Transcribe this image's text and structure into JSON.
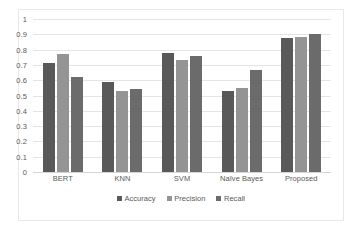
{
  "chart_data": {
    "type": "bar",
    "title": "",
    "subtitle": "",
    "xlabel": "",
    "ylabel": "",
    "ylim": [
      0,
      1
    ],
    "y_ticks": [
      "0",
      "0.1",
      "0.2",
      "0.3",
      "0.4",
      "0.5",
      "0.6",
      "0.7",
      "0.8",
      "0.9",
      "1"
    ],
    "grid": true,
    "legend_position": "bottom",
    "categories": [
      "BERT",
      "KNN",
      "SVM",
      "Naïve Bayes",
      "Proposed"
    ],
    "series": [
      {
        "name": "Accuracy",
        "color": "#595959",
        "values": [
          0.71,
          0.59,
          0.775,
          0.53,
          0.875
        ]
      },
      {
        "name": "Precision",
        "color": "#949494",
        "values": [
          0.77,
          0.53,
          0.735,
          0.55,
          0.88
        ]
      },
      {
        "name": "Recall",
        "color": "#6b6b6b",
        "values": [
          0.62,
          0.545,
          0.76,
          0.665,
          0.905
        ]
      }
    ]
  },
  "style": {
    "background_color": "#ffffff",
    "gridline_color": "#e4e4e4",
    "frame_color": "#e8e8e8",
    "text_color": "#595959"
  }
}
